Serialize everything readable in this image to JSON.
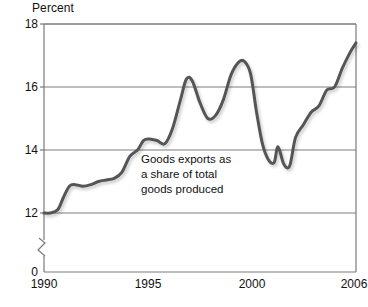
{
  "chart_data": {
    "type": "line",
    "title": "",
    "ylabel": "Percent",
    "xlabel": "",
    "ylim": [
      12,
      18
    ],
    "xlim": [
      1990,
      2006
    ],
    "yticks": [
      18,
      16,
      14,
      12,
      0
    ],
    "ytick_labels": [
      "18",
      "16",
      "14",
      "12",
      "0"
    ],
    "xticks": [
      1990,
      1995,
      2000,
      2006
    ],
    "xtick_labels": [
      "1990",
      "1995",
      "2000",
      "2006"
    ],
    "axis_break": true,
    "axis_break_between": [
      0,
      12
    ],
    "grid": "horizontal",
    "legend": "none",
    "annotations": [
      {
        "text": "Goods exports as\na share of total\ngoods produced",
        "x": 1996.3,
        "y": 13.8
      }
    ],
    "series": [
      {
        "name": "Goods exports as a share of total goods produced",
        "color": "#555555",
        "x": [
          1990.0,
          1990.3,
          1990.7,
          1991.0,
          1991.3,
          1991.6,
          1992.0,
          1992.4,
          1992.8,
          1993.2,
          1993.6,
          1994.0,
          1994.4,
          1994.8,
          1995.1,
          1995.4,
          1995.8,
          1996.2,
          1996.6,
          1997.0,
          1997.3,
          1997.6,
          1998.0,
          1998.4,
          1998.8,
          1999.2,
          1999.6,
          2000.0,
          2000.3,
          2000.6,
          2000.9,
          2001.2,
          2001.5,
          2001.8,
          2002.0,
          2002.3,
          2002.6,
          2002.9,
          2003.3,
          2003.7,
          2004.1,
          2004.5,
          2004.9,
          2005.3,
          2005.7,
          2006.0
        ],
        "y": [
          12.0,
          12.0,
          12.1,
          12.5,
          12.85,
          12.9,
          12.85,
          12.9,
          13.0,
          13.05,
          13.1,
          13.3,
          13.8,
          14.0,
          14.3,
          14.35,
          14.3,
          14.2,
          14.7,
          15.6,
          16.25,
          16.2,
          15.5,
          15.0,
          15.1,
          15.6,
          16.4,
          16.8,
          16.8,
          16.4,
          15.2,
          14.2,
          13.7,
          13.6,
          14.1,
          13.55,
          13.5,
          14.4,
          14.8,
          15.2,
          15.4,
          15.9,
          16.0,
          16.6,
          17.1,
          17.4
        ]
      }
    ]
  },
  "layout": {
    "plot_left": 44,
    "plot_right": 356,
    "plot_top": 24,
    "plot_bottom": 272,
    "y_top_value": 18,
    "y_bottom_value": 12,
    "y_baseline_zero_px": 272,
    "y_12_px": 213
  },
  "colors": {
    "line": "#555555",
    "axis": "#7a7a7a",
    "grid": "#6e6e6e",
    "background": "#ffffff",
    "text": "#111111"
  }
}
